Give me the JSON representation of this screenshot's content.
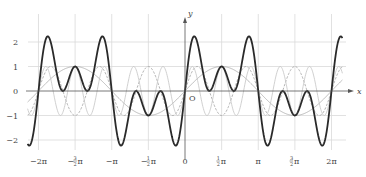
{
  "chart_data": {
    "type": "line",
    "title": "",
    "xlabel": "x",
    "ylabel": "y",
    "origin_label": "O",
    "xlim": [
      -6.75,
      6.75
    ],
    "ylim": [
      -2.6,
      2.6
    ],
    "grid": true,
    "x_ticks": [
      {
        "value": -6.2832,
        "label": "−2π"
      },
      {
        "value": -4.7124,
        "label": "−",
        "num": "3",
        "den": "2",
        "suffix": "π"
      },
      {
        "value": -3.1416,
        "label": "−π"
      },
      {
        "value": -1.5708,
        "label": "−",
        "num": "1",
        "den": "2",
        "suffix": "π"
      },
      {
        "value": 0,
        "label": "0"
      },
      {
        "value": 1.5708,
        "label": "",
        "num": "1",
        "den": "2",
        "suffix": "π"
      },
      {
        "value": 3.1416,
        "label": "π"
      },
      {
        "value": 4.7124,
        "label": "",
        "num": "3",
        "den": "2",
        "suffix": "π"
      },
      {
        "value": 6.2832,
        "label": "2π"
      }
    ],
    "y_ticks": [
      {
        "value": 2,
        "label": "2"
      },
      {
        "value": 1,
        "label": "1"
      },
      {
        "value": 0,
        "label": "0"
      },
      {
        "value": -1,
        "label": "−1"
      },
      {
        "value": -2,
        "label": "−2"
      }
    ],
    "series": [
      {
        "name": "sin(x)",
        "expr": "sin1",
        "color": "#a8a8a8",
        "style": "solid"
      },
      {
        "name": "sin(3x)",
        "expr": "sin3",
        "color": "#a0a0a0",
        "style": "dashed"
      },
      {
        "name": "sin(5x)",
        "expr": "sin5",
        "color": "#c4c4c4",
        "style": "solid"
      },
      {
        "name": "sin(x)+sin(3x)+sin(5x)",
        "expr": "sum",
        "color": "#2a2a2a",
        "style": "bold"
      }
    ]
  }
}
